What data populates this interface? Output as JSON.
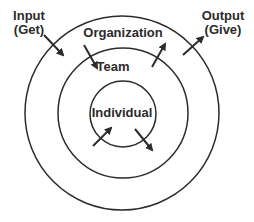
{
  "diagram": {
    "colors": {
      "line": "#2b2b2b",
      "text": "#2b2b2b",
      "background": "#ffffff"
    },
    "circles": [
      {
        "name": "organization-circle",
        "cx": 122,
        "cy": 113,
        "r": 97
      },
      {
        "name": "team-circle",
        "cx": 123,
        "cy": 113,
        "r": 65
      },
      {
        "name": "individual-circle",
        "cx": 123,
        "cy": 114,
        "r": 33
      }
    ],
    "labels": {
      "input_line1": "Input",
      "input_line2": "(Get)",
      "output_line1": "Output",
      "output_line2": "(Give)",
      "organization": "Organization",
      "team": "Team",
      "individual": "Individual"
    },
    "arrows": [
      {
        "name": "input-arrow",
        "from": [
          44,
          35
        ],
        "to": [
          63,
          55
        ]
      },
      {
        "name": "organization-to-team-arrow",
        "from": [
          84,
          45
        ],
        "to": [
          97,
          68
        ]
      },
      {
        "name": "team-to-organization-arrow",
        "from": [
          152,
          67
        ],
        "to": [
          165,
          44
        ]
      },
      {
        "name": "output-arrow",
        "from": [
          183,
          55
        ],
        "to": [
          203,
          37
        ]
      },
      {
        "name": "team-to-individual-arrow",
        "from": [
          93,
          146
        ],
        "to": [
          111,
          128
        ]
      },
      {
        "name": "individual-to-team-arrow",
        "from": [
          135,
          129
        ],
        "to": [
          152,
          150
        ]
      }
    ]
  }
}
